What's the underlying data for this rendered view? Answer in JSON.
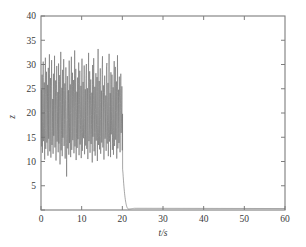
{
  "chart_data": {
    "type": "line",
    "title": "",
    "subtitle": "",
    "xlabel": "t/s",
    "ylabel": "z",
    "xlim": [
      0,
      60
    ],
    "ylim": [
      0,
      40
    ],
    "xticks": [
      0,
      10,
      20,
      30,
      40,
      50,
      60
    ],
    "xtick_labels": [
      "0",
      "10",
      "20",
      "30",
      "40",
      "50",
      "60"
    ],
    "yticks": [
      0,
      5,
      10,
      15,
      20,
      25,
      30,
      35,
      40
    ],
    "ytick_labels": [
      "",
      "5",
      "10",
      "15",
      "20",
      "25",
      "30",
      "35",
      "40"
    ],
    "grid": false,
    "legend": null,
    "line_color": "#707070",
    "axis_color": "#7d7d7d",
    "background_color": "#ffffff",
    "annotations": [],
    "series": [
      {
        "name": "z",
        "chaotic_segment": {
          "t_start": 0,
          "t_end": 20.1,
          "mean": 18.6,
          "min": 6.9,
          "max": 33.2,
          "dominant_period_s": 0.36,
          "samples_t": [
            0.0,
            0.09,
            0.18,
            0.27,
            0.36,
            0.45,
            0.54,
            0.63,
            0.72,
            0.81,
            0.9,
            0.99,
            1.08,
            1.17,
            1.26,
            1.35,
            1.44,
            1.53,
            1.62,
            1.71,
            1.8,
            1.89,
            1.98,
            2.07,
            2.16,
            2.25,
            2.34,
            2.43,
            2.52,
            2.61,
            2.7,
            2.79,
            2.88,
            2.97,
            3.06,
            3.15,
            3.24,
            3.33,
            3.42,
            3.51,
            3.6,
            3.69,
            3.78,
            3.87,
            3.96,
            4.05,
            4.14,
            4.23,
            4.32,
            4.41,
            4.5,
            4.59,
            4.68,
            4.77,
            4.86,
            4.95,
            5.04,
            5.13,
            5.22,
            5.31,
            5.4,
            5.49,
            5.58,
            5.67,
            5.76,
            5.85,
            5.94,
            6.03,
            6.12,
            6.21,
            6.3,
            6.39,
            6.48,
            6.57,
            6.66,
            6.75,
            6.84,
            6.93,
            7.02,
            7.11,
            7.2,
            7.29,
            7.38,
            7.47,
            7.56,
            7.65,
            7.74,
            7.83,
            7.92,
            8.01,
            8.1,
            8.19,
            8.28,
            8.37,
            8.46,
            8.55,
            8.64,
            8.73,
            8.82,
            8.91,
            9.0,
            9.09,
            9.18,
            9.27,
            9.36,
            9.45,
            9.54,
            9.63,
            9.72,
            9.81,
            9.9,
            9.99,
            10.08,
            10.17,
            10.26,
            10.35,
            10.44,
            10.53,
            10.62,
            10.71,
            10.8,
            10.89,
            10.98,
            11.07,
            11.16,
            11.25,
            11.34,
            11.43,
            11.52,
            11.61,
            11.7,
            11.79,
            11.88,
            11.97,
            12.06,
            12.15,
            12.24,
            12.33,
            12.42,
            12.51,
            12.6,
            12.69,
            12.78,
            12.87,
            12.96,
            13.05,
            13.14,
            13.23,
            13.32,
            13.41,
            13.5,
            13.59,
            13.68,
            13.77,
            13.86,
            13.95,
            14.04,
            14.13,
            14.22,
            14.31,
            14.4,
            14.49,
            14.58,
            14.67,
            14.76,
            14.85,
            14.94,
            15.03,
            15.12,
            15.21,
            15.3,
            15.39,
            15.48,
            15.57,
            15.66,
            15.75,
            15.84,
            15.93,
            16.02,
            16.11,
            16.2,
            16.29,
            16.38,
            16.47,
            16.56,
            16.65,
            16.74,
            16.83,
            16.92,
            17.01,
            17.1,
            17.19,
            17.28,
            17.37,
            17.46,
            17.55,
            17.64,
            17.73,
            17.82,
            17.91,
            18.0,
            18.09,
            18.18,
            18.27,
            18.36,
            18.45,
            18.54,
            18.63,
            18.72,
            18.81,
            18.9,
            18.99,
            19.08,
            19.17,
            19.26,
            19.35,
            19.44,
            19.53,
            19.62,
            19.71,
            19.8,
            19.89,
            19.98,
            20.07
          ],
          "samples_z": [
            15.2,
            24.8,
            13.1,
            27.9,
            11.8,
            22.4,
            30.6,
            14.2,
            18.9,
            26.3,
            10.4,
            23.7,
            31.4,
            12.6,
            20.1,
            28.5,
            13.9,
            17.2,
            25.8,
            11.2,
            29.3,
            14.7,
            21.6,
            32.1,
            12.1,
            19.4,
            27.2,
            10.8,
            24.1,
            30.9,
            13.4,
            16.8,
            22.9,
            11.6,
            28.1,
            15.3,
            20.7,
            31.8,
            12.9,
            18.2,
            26.7,
            10.2,
            23.4,
            29.7,
            14.1,
            17.6,
            24.3,
            11.9,
            30.2,
            13.7,
            21.1,
            27.8,
            9.4,
            19.8,
            32.6,
            12.3,
            16.4,
            25.2,
            11.1,
            28.9,
            14.9,
            20.4,
            31.1,
            13.2,
            18.7,
            26.1,
            10.6,
            22.8,
            29.4,
            15.7,
            6.9,
            21.3,
            27.6,
            12.7,
            17.9,
            24.7,
            11.4,
            30.8,
            13.8,
            19.1,
            25.9,
            10.9,
            23.2,
            31.6,
            12.4,
            16.1,
            28.3,
            14.4,
            20.9,
            26.8,
            11.7,
            18.4,
            32.9,
            13.1,
            22.1,
            29.1,
            10.3,
            15.8,
            24.4,
            12.8,
            27.3,
            14.6,
            19.6,
            30.4,
            11.3,
            21.8,
            28.7,
            13.5,
            17.4,
            25.6,
            10.7,
            23.9,
            31.2,
            12.2,
            18.9,
            26.4,
            14.8,
            20.2,
            29.8,
            11.5,
            16.6,
            24.9,
            13.3,
            27.1,
            30.1,
            12.6,
            19.3,
            25.1,
            10.5,
            22.6,
            32.4,
            14.2,
            17.1,
            28.6,
            11.8,
            21.4,
            26.9,
            13.6,
            18.6,
            24.2,
            9.8,
            29.9,
            15.1,
            20.6,
            31.3,
            12.1,
            16.9,
            25.4,
            11.2,
            23.1,
            28.2,
            14.3,
            19.9,
            27.4,
            10.1,
            22.3,
            33.2,
            13.4,
            17.7,
            26.6,
            12.5,
            20.8,
            29.2,
            11.6,
            15.4,
            24.6,
            13.9,
            28.8,
            31.7,
            12.9,
            18.1,
            25.7,
            10.4,
            21.9,
            27.7,
            14.7,
            16.3,
            23.6,
            12.2,
            29.6,
            30.3,
            13.7,
            19.7,
            26.2,
            11.1,
            22.7,
            32.2,
            14.1,
            17.3,
            24.1,
            10.9,
            28.4,
            15.6,
            20.3,
            27.9,
            12.4,
            18.8,
            25.3,
            11.4,
            23.8,
            30.7,
            13.2,
            16.7,
            29.5,
            14.5,
            21.2,
            26.5,
            10.6,
            19.2,
            31.9,
            12.7,
            17.8,
            24.8,
            13.8,
            27.5,
            22.2,
            11.9,
            20.5,
            28.1,
            15.9,
            18.3,
            25.5,
            12.3,
            21.7,
            30.2,
            13.1,
            16.2,
            23.3,
            10.8,
            26.8,
            14.9,
            19.5,
            29.3,
            12.6,
            22.4,
            27.2,
            11.3,
            16.9,
            8.4
          ],
          "samples_note": "Representative chaotic trace read from the plot; sampled values approximate the envelope and density of oscillation visible in the figure."
        },
        "collapse": {
          "t_drop_start": 20.1,
          "t_drop_end": 21.6,
          "z_at_drop_start": 8.4,
          "overshoot_min": 0.2,
          "settle_t": 23.0,
          "baseline_z": 0.35,
          "t_final": 60,
          "z_final": 0.3
        }
      }
    ]
  }
}
